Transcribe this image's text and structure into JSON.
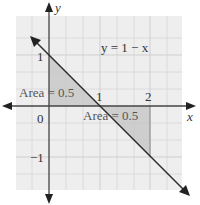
{
  "diagram": {
    "equation_label": "y = 1 − x",
    "axes": {
      "x_label": "x",
      "y_label": "y"
    },
    "tick_labels": {
      "y_one": "1",
      "y_neg_one": "−1",
      "origin": "0",
      "x_one": "1",
      "x_two": "2"
    },
    "regions": [
      {
        "label": "Area = 0.5",
        "vertices": [
          [
            0,
            0
          ],
          [
            0,
            1
          ],
          [
            1,
            0
          ]
        ],
        "fill": "#c8c8c8"
      },
      {
        "label": "Area = 0.5",
        "vertices": [
          [
            1,
            0
          ],
          [
            2,
            0
          ],
          [
            2,
            -1
          ]
        ],
        "fill": "#c8c8c8"
      }
    ],
    "line": {
      "equation": "y = 1 - x",
      "from": [
        -0.6,
        1.6
      ],
      "to": [
        2.7,
        -1.7
      ]
    },
    "grid": {
      "step": 0.333,
      "color": "#d4d4d4",
      "background": "#eeeeee"
    },
    "colors": {
      "axis": "#444444",
      "line": "#2a2a2a",
      "shade": "#c8c8c8",
      "grid_bg": "#eeeeee",
      "grid_line": "#d6d6d6"
    }
  }
}
